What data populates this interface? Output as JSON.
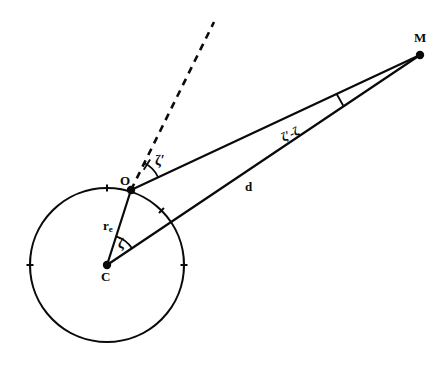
{
  "figure": {
    "kind": "geometry-diagram",
    "background_color": "#ffffff",
    "stroke_color": "#0a0a0a"
  },
  "points": [
    {
      "id": "C",
      "label": "C",
      "x": 107,
      "y": 265,
      "label_x": 101,
      "label_y": 270,
      "dot": true
    },
    {
      "id": "O",
      "label": "O",
      "x": 131,
      "y": 190,
      "label_x": 120,
      "label_y": 174,
      "dot": true
    },
    {
      "id": "M",
      "label": "M",
      "x": 420,
      "y": 55,
      "label_x": 414,
      "label_y": 31,
      "dot": true
    }
  ],
  "circle": {
    "name": "earth-circle",
    "center_x": 107,
    "center_y": 265,
    "radius": 77,
    "tick_angles_deg": [
      90,
      0,
      180,
      45
    ],
    "tick_length": 7
  },
  "segments": [
    {
      "id": "C-O",
      "from": "C",
      "to": "O",
      "label": "r",
      "label_sub": "e",
      "label_x": 103,
      "label_y": 219
    },
    {
      "id": "O-M",
      "from": "O",
      "to": "M",
      "label": "",
      "label_sub": ""
    },
    {
      "id": "C-M",
      "from": "C",
      "to": "M",
      "label": "d",
      "label_x": 245,
      "label_y": 180
    }
  ],
  "dashed_line": {
    "name": "zenith-direction",
    "from_x": 131,
    "from_y": 190,
    "to_x": 214,
    "to_y": 22,
    "dash": "7 6"
  },
  "angles": [
    {
      "id": "zeta-prime",
      "label": "ζ′",
      "at_point": "O",
      "label_x": 155,
      "label_y": 154,
      "arc_radius": 30,
      "tick_mark": true
    },
    {
      "id": "zeta",
      "label": "ζ",
      "at_point": "C",
      "label_x": 118,
      "label_y": 237,
      "arc_radius": 30,
      "tick_mark": false
    },
    {
      "id": "zeta-prime-minus-zeta",
      "label": "ζ′-ζ",
      "at_point": "M",
      "label_x": 282,
      "label_y": 132,
      "rotation_deg": -25,
      "tick_mark": true
    }
  ]
}
